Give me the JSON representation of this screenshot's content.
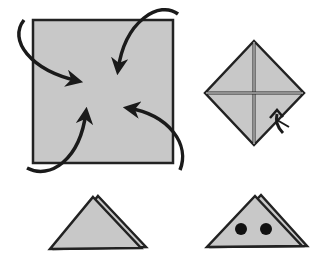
{
  "diagram": {
    "type": "origami-instructions",
    "colors": {
      "paper": "#c8c8c8",
      "outline": "#222222",
      "crease": "#ffffff",
      "arrow": "#1a1a1a",
      "eye": "#111111",
      "background": "#ffffff"
    },
    "steps": [
      {
        "id": 1,
        "shape": "square",
        "action": "fold four corners to center",
        "arrows": 4
      },
      {
        "id": 2,
        "shape": "diamond",
        "action": "turn over",
        "creases": "cross"
      },
      {
        "id": 3,
        "shape": "triangle",
        "action": "fold in half"
      },
      {
        "id": 4,
        "shape": "triangle-with-eyes",
        "action": "draw eyes",
        "eyes": 2
      }
    ]
  }
}
